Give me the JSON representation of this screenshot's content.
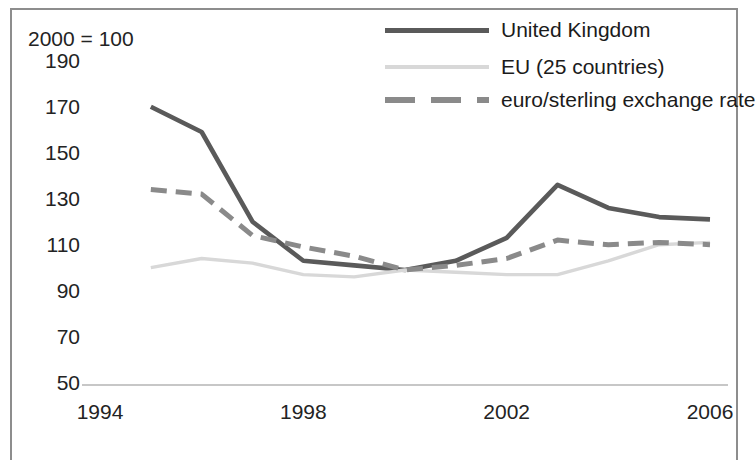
{
  "chart_data": {
    "type": "line",
    "title": "",
    "subtitle": "",
    "index_note": "2000 = 100",
    "xlabel": "",
    "ylabel": "",
    "x": [
      1995,
      1996,
      1997,
      1998,
      1999,
      2000,
      2001,
      2002,
      2003,
      2004,
      2005,
      2006
    ],
    "xlim": [
      1994,
      2006
    ],
    "ylim": [
      50,
      190
    ],
    "xticks": [
      "1994",
      "1998",
      "2002",
      "2006"
    ],
    "xtick_values": [
      1994,
      1998,
      2002,
      2006
    ],
    "yticks": [
      "190",
      "170",
      "150",
      "130",
      "110",
      "90",
      "70",
      "50"
    ],
    "ytick_values": [
      190,
      170,
      150,
      130,
      110,
      90,
      70,
      50
    ],
    "grid": false,
    "legend_position": "top-right",
    "series": [
      {
        "name": "United Kingdom",
        "color": "#5a5a5a",
        "style": "solid",
        "values": [
          171,
          160,
          121,
          104,
          102,
          100,
          104,
          114,
          137,
          127,
          123,
          122
        ]
      },
      {
        "name": "EU (25 countries)",
        "color": "#d8d8d8",
        "style": "solid",
        "values": [
          101,
          105,
          103,
          98,
          97,
          100,
          99,
          98,
          98,
          104,
          111,
          112
        ]
      },
      {
        "name": "euro/sterling exchange rate",
        "color": "#8a8a8a",
        "style": "dashed",
        "values": [
          135,
          133,
          115,
          110,
          106,
          100,
          102,
          105,
          113,
          111,
          112,
          111
        ]
      }
    ]
  },
  "axis": {
    "index_note": "2000 = 100"
  },
  "colors": {
    "uk": "#5a5a5a",
    "eu": "#d8d8d8",
    "euro": "#8a8a8a",
    "axis": "#b5b5b5",
    "border": "#8d8d8d"
  }
}
